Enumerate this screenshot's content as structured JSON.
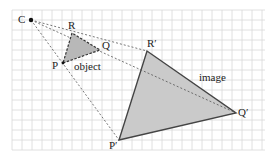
{
  "diagram": {
    "type": "enlargement",
    "centre": {
      "label": "C",
      "x": 31,
      "y": 20
    },
    "object": {
      "label": "object",
      "points": {
        "P": [
          63,
          63
        ],
        "Q": [
          100,
          50
        ],
        "R": [
          72,
          33
        ]
      },
      "labels": {
        "P": "P",
        "Q": "Q",
        "R": "R"
      }
    },
    "image": {
      "label": "image",
      "points": {
        "P": [
          119,
          140
        ],
        "Q": [
          236,
          113
        ],
        "R": [
          147,
          51
        ]
      },
      "labels": {
        "P": "P′",
        "Q": "Q′",
        "R": "R′"
      }
    },
    "colors": {
      "grid": "#d4d4d4",
      "fill": "#c8c8c8",
      "stroke": "#444444",
      "ray": "#555555"
    }
  }
}
